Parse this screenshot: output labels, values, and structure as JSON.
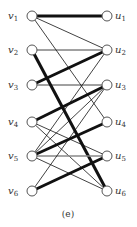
{
  "caption": "(e)",
  "left_nodes": [
    {
      "id": "v1",
      "base": "v",
      "sub": "1",
      "x": 32,
      "y": 16
    },
    {
      "id": "v2",
      "base": "v",
      "sub": "2",
      "x": 32,
      "y": 50
    },
    {
      "id": "v3",
      "base": "v",
      "sub": "3",
      "x": 32,
      "y": 85
    },
    {
      "id": "v4",
      "base": "v",
      "sub": "4",
      "x": 32,
      "y": 122
    },
    {
      "id": "v5",
      "base": "v",
      "sub": "5",
      "x": 32,
      "y": 156
    },
    {
      "id": "v6",
      "base": "v",
      "sub": "6",
      "x": 32,
      "y": 191
    }
  ],
  "right_nodes": [
    {
      "id": "u1",
      "base": "u",
      "sub": "1",
      "x": 107,
      "y": 16
    },
    {
      "id": "u2",
      "base": "u",
      "sub": "2",
      "x": 107,
      "y": 50
    },
    {
      "id": "u3",
      "base": "u",
      "sub": "3",
      "x": 107,
      "y": 85
    },
    {
      "id": "u4",
      "base": "u",
      "sub": "4",
      "x": 107,
      "y": 122
    },
    {
      "id": "u5",
      "base": "u",
      "sub": "5",
      "x": 107,
      "y": 156
    },
    {
      "id": "u6",
      "base": "u",
      "sub": "6",
      "x": 107,
      "y": 191
    }
  ],
  "edges": [
    {
      "from": "v1",
      "to": "u1",
      "matched": true
    },
    {
      "from": "v1",
      "to": "u2",
      "matched": false
    },
    {
      "from": "v1",
      "to": "u4",
      "matched": false
    },
    {
      "from": "v2",
      "to": "u2",
      "matched": false
    },
    {
      "from": "v2",
      "to": "u6",
      "matched": true
    },
    {
      "from": "v3",
      "to": "u2",
      "matched": true
    },
    {
      "from": "v3",
      "to": "u3",
      "matched": false
    },
    {
      "from": "v4",
      "to": "u3",
      "matched": true
    },
    {
      "from": "v4",
      "to": "u5",
      "matched": false
    },
    {
      "from": "v4",
      "to": "u6",
      "matched": false
    },
    {
      "from": "v5",
      "to": "u4",
      "matched": true
    },
    {
      "from": "v5",
      "to": "u5",
      "matched": false,
      "gray": true
    },
    {
      "from": "v5",
      "to": "u2",
      "matched": false
    },
    {
      "from": "v5",
      "to": "u3",
      "matched": false
    },
    {
      "from": "v5",
      "to": "u6",
      "matched": false
    },
    {
      "from": "v6",
      "to": "u5",
      "matched": true
    },
    {
      "from": "v6",
      "to": "u3",
      "matched": false
    }
  ],
  "style": {
    "node_radius": 5,
    "thick_width": 3,
    "thin_width": 0.8,
    "edge_color": "#111111",
    "gray_color": "#888888",
    "node_stroke": "#555555"
  }
}
